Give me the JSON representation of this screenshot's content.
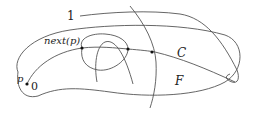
{
  "diagram": {
    "type": "topological-sketch",
    "labels": {
      "one": "1",
      "next_p": "next(p)",
      "p": "p",
      "zero": "0",
      "C": "C",
      "F": "F"
    },
    "elements": [
      {
        "name": "region-F",
        "description": "closed outer boundary curve"
      },
      {
        "name": "curve-C",
        "description": "curve from p through next(p) to the right"
      },
      {
        "name": "curve-1",
        "description": "curve labeled 1 crossing the region"
      },
      {
        "name": "loop",
        "description": "closed loop near next(p)"
      },
      {
        "name": "arch",
        "description": "arch-shaped curve inside loop"
      },
      {
        "name": "vertical-arc",
        "description": "long arc crossing C"
      }
    ],
    "points": [
      {
        "name": "p",
        "x": 27,
        "y": 84
      },
      {
        "name": "next-p",
        "x": 82,
        "y": 48
      },
      {
        "name": "intersection-2",
        "x": 128,
        "y": 49
      },
      {
        "name": "intersection-3",
        "x": 152,
        "y": 52
      }
    ],
    "colors": {
      "stroke": "#555555",
      "text": "#222222",
      "background": "#ffffff"
    }
  }
}
